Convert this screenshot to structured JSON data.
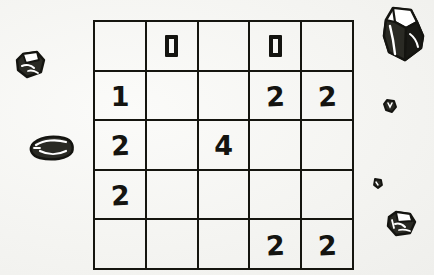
{
  "scene": {
    "title": "Number puzzle grid with scattered stones",
    "background_color": "#f4f4f1",
    "ink_color": "#141410"
  },
  "grid": {
    "name": "puzzle-grid",
    "rows": 5,
    "columns": 5,
    "cell_width_px": 50,
    "cell_height_px": 48,
    "origin_x_px": 93,
    "origin_y_px": 20,
    "border_color": "#15150f",
    "cells": [
      [
        {
          "value": "",
          "glyph": "empty"
        },
        {
          "value": "0",
          "glyph": "zero-block"
        },
        {
          "value": "",
          "glyph": "empty"
        },
        {
          "value": "0",
          "glyph": "zero-block"
        },
        {
          "value": "",
          "glyph": "empty"
        }
      ],
      [
        {
          "value": "1",
          "glyph": "digit"
        },
        {
          "value": "",
          "glyph": "empty"
        },
        {
          "value": "",
          "glyph": "empty"
        },
        {
          "value": "2",
          "glyph": "digit"
        },
        {
          "value": "2",
          "glyph": "digit"
        }
      ],
      [
        {
          "value": "2",
          "glyph": "digit"
        },
        {
          "value": "",
          "glyph": "empty"
        },
        {
          "value": "4",
          "glyph": "digit"
        },
        {
          "value": "",
          "glyph": "empty"
        },
        {
          "value": "",
          "glyph": "empty"
        }
      ],
      [
        {
          "value": "2",
          "glyph": "digit"
        },
        {
          "value": "",
          "glyph": "empty"
        },
        {
          "value": "",
          "glyph": "empty"
        },
        {
          "value": "",
          "glyph": "empty"
        },
        {
          "value": "",
          "glyph": "empty"
        }
      ],
      [
        {
          "value": "",
          "glyph": "empty"
        },
        {
          "value": "",
          "glyph": "empty"
        },
        {
          "value": "",
          "glyph": "empty"
        },
        {
          "value": "2",
          "glyph": "digit"
        },
        {
          "value": "2",
          "glyph": "digit"
        }
      ]
    ]
  },
  "rocks": [
    {
      "name": "rock-top-right-large",
      "x": 381,
      "y": 6,
      "w": 44,
      "h": 58,
      "shape": "angular-boulder"
    },
    {
      "name": "rock-left-small",
      "x": 15,
      "y": 50,
      "w": 30,
      "h": 28,
      "shape": "chipped-stone"
    },
    {
      "name": "rock-left-flat",
      "x": 26,
      "y": 133,
      "w": 48,
      "h": 28,
      "shape": "flat-slab"
    },
    {
      "name": "rock-right-pebble-top",
      "x": 383,
      "y": 98,
      "w": 13,
      "h": 14,
      "shape": "pebble"
    },
    {
      "name": "rock-right-pebble-mid",
      "x": 372,
      "y": 177,
      "w": 10,
      "h": 11,
      "shape": "pebble"
    },
    {
      "name": "rock-right-bottom",
      "x": 386,
      "y": 210,
      "w": 30,
      "h": 26,
      "shape": "chipped-stone"
    }
  ]
}
